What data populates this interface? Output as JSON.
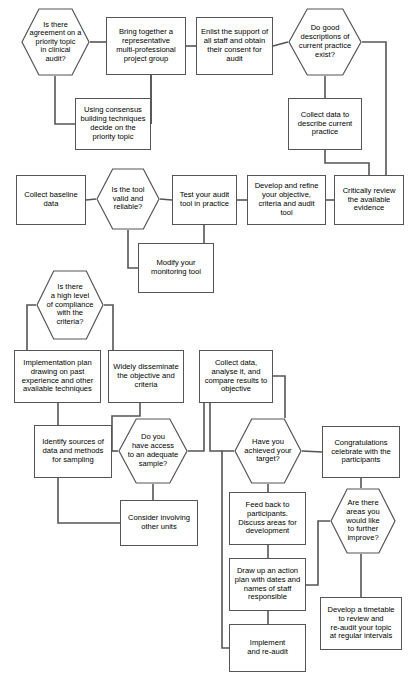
{
  "diagram": {
    "stroke_color": "#555555",
    "text_color": "#000000",
    "background": "#ffffff"
  },
  "nodes": [
    {
      "id": "agreement",
      "shape": "decision",
      "text": "Is there\nagreement on a\npriority topic\nin clinical\naudit?",
      "x": 21,
      "y": 8,
      "w": 69,
      "h": 68,
      "fs": 7.4
    },
    {
      "id": "bring-together",
      "shape": "process",
      "text": "Bring together a\nrepresentative\nmulti-professional\nproject group",
      "x": 106,
      "y": 17,
      "w": 80,
      "h": 58,
      "fs": 7.6
    },
    {
      "id": "enlist-support",
      "shape": "process",
      "text": "Enlist the support of\nall staff and obtain\ntheir consent for\naudit",
      "x": 196,
      "y": 17,
      "w": 77,
      "h": 58,
      "fs": 7.6
    },
    {
      "id": "good-descriptions",
      "shape": "decision",
      "text": "Do good\ndescriptions of\ncurrent practice\nexist?",
      "x": 288,
      "y": 8,
      "w": 74,
      "h": 68,
      "fs": 7.6
    },
    {
      "id": "using-consensus",
      "shape": "process",
      "text": "Using consensus\nbuilding techniques\ndecide on the\npriority topic",
      "x": 75,
      "y": 98,
      "w": 76,
      "h": 52,
      "fs": 7.6
    },
    {
      "id": "collect-describe",
      "shape": "process",
      "text": "Collect data to\ndescribe current\npractice",
      "x": 288,
      "y": 98,
      "w": 74,
      "h": 52,
      "fs": 7.6
    },
    {
      "id": "collect-baseline",
      "shape": "process",
      "text": "Collect baseline\ndata",
      "x": 16,
      "y": 175,
      "w": 70,
      "h": 50,
      "fs": 7.6
    },
    {
      "id": "tool-valid",
      "shape": "decision",
      "text": "Is the tool\nvalid and\nreliable?",
      "x": 96,
      "y": 168,
      "w": 64,
      "h": 62,
      "fs": 7.6
    },
    {
      "id": "test-tool",
      "shape": "process",
      "text": "Test your audit\ntool in practice",
      "x": 172,
      "y": 175,
      "w": 65,
      "h": 50,
      "fs": 7.6
    },
    {
      "id": "develop-refine",
      "shape": "process",
      "text": "Develop and refine\nyour objective,\ncriteria and audit\ntool",
      "x": 247,
      "y": 175,
      "w": 79,
      "h": 50,
      "fs": 7.6
    },
    {
      "id": "critically-review",
      "shape": "process",
      "text": "Critically review\nthe available\nevidence",
      "x": 334,
      "y": 175,
      "w": 70,
      "h": 50,
      "fs": 7.6
    },
    {
      "id": "modify-tool",
      "shape": "process",
      "text": "Modify your\nmonitoring tool",
      "x": 138,
      "y": 243,
      "w": 76,
      "h": 50,
      "fs": 7.6
    },
    {
      "id": "compliance",
      "shape": "decision",
      "text": "Is there\na high level\nof compliance\nwith the\ncriteria?",
      "x": 36,
      "y": 270,
      "w": 68,
      "h": 70,
      "fs": 7.6
    },
    {
      "id": "implementation-plan",
      "shape": "process",
      "text": "Implementation plan\ndrawing on past\nexperience and other\navailable techniques",
      "x": 14,
      "y": 350,
      "w": 87,
      "h": 53,
      "fs": 7.6
    },
    {
      "id": "widely-disseminate",
      "shape": "process",
      "text": "Widely disseminate\nthe objective and\ncriteria",
      "x": 108,
      "y": 350,
      "w": 76,
      "h": 53,
      "fs": 7.6
    },
    {
      "id": "collect-analyse",
      "shape": "process",
      "text": "Collect data,\nanalyse it, and\ncompare results to\nobjective",
      "x": 199,
      "y": 350,
      "w": 74,
      "h": 53,
      "fs": 7.6
    },
    {
      "id": "identify-sources",
      "shape": "process",
      "text": "Identify sources of\ndata and methods\nfor sampling",
      "x": 34,
      "y": 425,
      "w": 78,
      "h": 53,
      "fs": 7.6
    },
    {
      "id": "adequate-sample",
      "shape": "decision",
      "text": "Do you\nhave access\nto an adequate\nsample?",
      "x": 118,
      "y": 418,
      "w": 70,
      "h": 66,
      "fs": 7.6
    },
    {
      "id": "achieved-target",
      "shape": "decision",
      "text": "Have you\nachieved your\ntarget?",
      "x": 234,
      "y": 418,
      "w": 68,
      "h": 66,
      "fs": 7.6
    },
    {
      "id": "congratulations",
      "shape": "process",
      "text": "Congratulations\ncelebrate with the\nparticipants",
      "x": 322,
      "y": 426,
      "w": 78,
      "h": 52,
      "fs": 7.6
    },
    {
      "id": "consider-units",
      "shape": "process",
      "text": "Consider involving\nother units",
      "x": 120,
      "y": 500,
      "w": 78,
      "h": 46,
      "fs": 7.6
    },
    {
      "id": "feed-back",
      "shape": "process",
      "text": "Feed back to\nparticipants.\nDiscuss areas for\ndevelopment",
      "x": 229,
      "y": 492,
      "w": 77,
      "h": 53,
      "fs": 7.6
    },
    {
      "id": "further-improve",
      "shape": "decision",
      "text": "Are there\nareas you\nwould like\nto further\nimprove?",
      "x": 330,
      "y": 488,
      "w": 66,
      "h": 66,
      "fs": 7.6
    },
    {
      "id": "action-plan",
      "shape": "process",
      "text": "Draw up an action\nplan with dates and\nnames of staff\nresponsible",
      "x": 229,
      "y": 558,
      "w": 77,
      "h": 53,
      "fs": 7.6
    },
    {
      "id": "develop-timetable",
      "shape": "process",
      "text": "Develop a timetable\nto review and\nre-audit your topic\nat regular intervals",
      "x": 320,
      "y": 597,
      "w": 82,
      "h": 53,
      "fs": 7.6
    },
    {
      "id": "implement-reaudit",
      "shape": "process",
      "text": "Implement\nand re-audit",
      "x": 229,
      "y": 624,
      "w": 77,
      "h": 48,
      "fs": 7.6
    }
  ],
  "edges": [
    {
      "id": "agreement-to-bring",
      "points": "90,42 106,42"
    },
    {
      "id": "bring-to-enlist",
      "points": "186,46 196,46"
    },
    {
      "id": "enlist-to-good",
      "points": "273,46 288,42"
    },
    {
      "id": "agreement-down-to-consensus",
      "points": "55,76 55,124 75,124"
    },
    {
      "id": "bring-down-to-consensus",
      "points": "151,75 151,124 151,124"
    },
    {
      "id": "bring-down-stub",
      "points": "151,75 151,124"
    },
    {
      "id": "good-down-to-collect",
      "points": "325,76 325,98"
    },
    {
      "id": "good-right-down",
      "points": "362,42 386,42 386,175"
    },
    {
      "id": "collect-down-to-critically",
      "points": "325,150 325,163 369,163 369,175"
    },
    {
      "id": "baseline-to-toolvalid",
      "points": "86,200 96,199"
    },
    {
      "id": "toolvalid-to-test",
      "points": "160,199 172,200"
    },
    {
      "id": "test-to-develop",
      "points": "237,200 247,200"
    },
    {
      "id": "develop-to-critically",
      "points": "326,200 334,200"
    },
    {
      "id": "toolvalid-down-to-modify",
      "points": "128,230 128,268 138,268"
    },
    {
      "id": "test-down-to-modify",
      "points": "204,225 204,243"
    },
    {
      "id": "compliance-left-down",
      "points": "36,305 27,305 27,350"
    },
    {
      "id": "compliance-right-down",
      "points": "104,305 113,305 113,350"
    },
    {
      "id": "implementation-down-to-identify",
      "points": "58,403 58,425"
    },
    {
      "id": "widely-down-to-identify",
      "points": "140,403 140,416 112,416 112,451"
    },
    {
      "id": "identify-to-adequate",
      "points": "112,451 118,451"
    },
    {
      "id": "adequate-right-up",
      "points": "188,451 204,451 204,403"
    },
    {
      "id": "adequate-down-to-consider",
      "points": "153,484 153,500"
    },
    {
      "id": "identify-down-loop",
      "points": "58,478 58,523 120,523"
    },
    {
      "id": "collect-analyse-right-down",
      "points": "273,376 285,376 285,418"
    },
    {
      "id": "collect-analyse-left-down",
      "points": "210,403 210,451 222,451"
    },
    {
      "id": "achieved-to-congratulations",
      "points": "302,451 322,452"
    },
    {
      "id": "achieved-left-long-down",
      "points": "234,451 222,451 222,648 229,648"
    },
    {
      "id": "achieved-down-to-feedback",
      "points": "268,484 268,492"
    },
    {
      "id": "congratulations-down-to-improve",
      "points": "361,478 361,488"
    },
    {
      "id": "feedback-down-to-action",
      "points": "268,545 268,558"
    },
    {
      "id": "action-to-improve",
      "points": "306,585 318,585 318,521 330,521"
    },
    {
      "id": "improve-down-to-timetable",
      "points": "361,554 361,597"
    },
    {
      "id": "action-down-to-implement",
      "points": "268,611 268,624"
    }
  ]
}
